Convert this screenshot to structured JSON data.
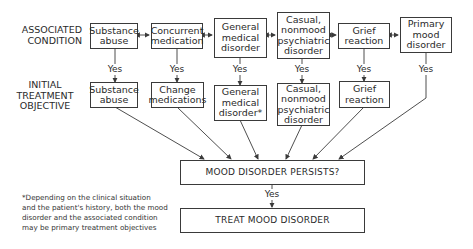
{
  "row_labels": {
    "associated": "ASSOCIATED\nCONDITION",
    "initial": "INITIAL\nTREATMENT\nOBJECTIVE"
  },
  "associated_conditions": [
    {
      "label": "Substance\nabuse"
    },
    {
      "label": "Concurrent\nmedication"
    },
    {
      "label": "General\nmedical\ndisorder"
    },
    {
      "label": "Casual,\nnonmood\npsychiatric\ndisorder"
    },
    {
      "label": "Grief\nreaction"
    },
    {
      "label": "Primary\nmood\ndisorder"
    }
  ],
  "treatment_objectives": [
    {
      "label": "Substance\nabuse"
    },
    {
      "label": "Change\nmedications"
    },
    {
      "label": "General\nmedical\ndisorder*"
    },
    {
      "label": "Casual,\nnonmood\npsychiatric\ndisorder"
    },
    {
      "label": "Grief\nreaction"
    }
  ],
  "edge_label": "Yes",
  "decision": "MOOD DISORDER PERSISTS?",
  "outcome": "TREAT MOOD DISORDER",
  "footnote": "*Depending on the clinical situation\nand the patient's history, both the mood\ndisorder and the associated condition\nmay be primary treatment objectives"
}
